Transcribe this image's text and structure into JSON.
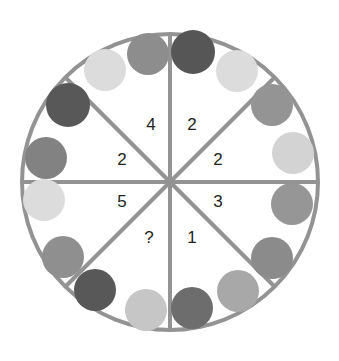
{
  "figure": {
    "title": "",
    "type": "circular-sector-dot-puzzle",
    "background_color": "#ffffff",
    "outline_color": "#939393",
    "spoke_color": "#939393",
    "outline_width": 4,
    "spoke_width": 4,
    "center": {
      "x": 170,
      "y": 182
    },
    "radius": 148
  },
  "chart_data": {
    "type": "pie",
    "title": "",
    "subtitle": "",
    "xlabel": "",
    "ylabel": "",
    "grid": false,
    "legend": "none",
    "note": "Circle split into 8 equal 45-degree sectors. Each sector carries a number label; gray dots sit near the rim inside each sector.",
    "categories": [
      "top-right",
      "right-upper",
      "right-lower",
      "bottom-right",
      "bottom-left",
      "left-lower",
      "left-upper",
      "top-left"
    ],
    "values": [
      2,
      2,
      3,
      1,
      2,
      5,
      2,
      4
    ],
    "labels": [
      "2",
      "2",
      "3",
      "1",
      "?",
      "5",
      "2",
      "4"
    ],
    "dot_counts": [
      2,
      2,
      3,
      1,
      2,
      5,
      2,
      4
    ],
    "unknown_label": "?",
    "unknown_sector": "bottom-left"
  },
  "sectors": [
    {
      "id": "sector-top-right",
      "label": "2",
      "label_x": 192,
      "label_y": 126
    },
    {
      "id": "sector-right-upper",
      "label": "2",
      "label_x": 218,
      "label_y": 161
    },
    {
      "id": "sector-right-lower",
      "label": "3",
      "label_x": 218,
      "label_y": 203
    },
    {
      "id": "sector-bottom-right",
      "label": "1",
      "label_x": 192,
      "label_y": 239
    },
    {
      "id": "sector-bottom-left",
      "label": "?",
      "label_x": 149,
      "label_y": 239
    },
    {
      "id": "sector-left-lower",
      "label": "5",
      "label_x": 122,
      "label_y": 203
    },
    {
      "id": "sector-left-upper",
      "label": "2",
      "label_x": 122,
      "label_y": 161
    },
    {
      "id": "sector-top-left",
      "label": "4",
      "label_x": 151,
      "label_y": 126
    }
  ],
  "spokes": [
    {
      "id": "spoke-vertical",
      "x1": 170,
      "y1": 34,
      "x2": 170,
      "y2": 330
    },
    {
      "id": "spoke-horizontal",
      "x1": 22,
      "y1": 182,
      "x2": 318,
      "y2": 182
    },
    {
      "id": "spoke-diagonal-nwse",
      "x1": 65,
      "y1": 77,
      "x2": 275,
      "y2": 287
    },
    {
      "id": "spoke-diagonal-nesw",
      "x1": 275,
      "y1": 77,
      "x2": 65,
      "y2": 287
    }
  ],
  "dots": [
    {
      "id": "dot-01",
      "sector": "top-left",
      "cx": 105,
      "cy": 70,
      "r": 21,
      "color": "#dcdcdc",
      "shade": "very-light"
    },
    {
      "id": "dot-02",
      "sector": "top-left",
      "cx": 148,
      "cy": 54,
      "r": 21,
      "color": "#8d8d8d",
      "shade": "medium"
    },
    {
      "id": "dot-03",
      "sector": "top-right",
      "cx": 193,
      "cy": 52,
      "r": 22,
      "color": "#565656",
      "shade": "dark"
    },
    {
      "id": "dot-04",
      "sector": "top-right",
      "cx": 237,
      "cy": 71,
      "r": 21,
      "color": "#dcdcdc",
      "shade": "very-light"
    },
    {
      "id": "dot-05",
      "sector": "right-upper",
      "cx": 272,
      "cy": 105,
      "r": 21,
      "color": "#949494",
      "shade": "medium"
    },
    {
      "id": "dot-06",
      "sector": "right-upper",
      "cx": 293,
      "cy": 153,
      "r": 21,
      "color": "#d3d3d3",
      "shade": "light"
    },
    {
      "id": "dot-07",
      "sector": "right-lower",
      "cx": 292,
      "cy": 204,
      "r": 21,
      "color": "#969696",
      "shade": "medium"
    },
    {
      "id": "dot-08",
      "sector": "right-lower",
      "cx": 272,
      "cy": 258,
      "r": 21,
      "color": "#8b8b8b",
      "shade": "medium"
    },
    {
      "id": "dot-09",
      "sector": "bottom-right",
      "cx": 238,
      "cy": 291,
      "r": 21,
      "color": "#a8a8a8",
      "shade": "light-medium"
    },
    {
      "id": "dot-10",
      "sector": "bottom-right",
      "cx": 192,
      "cy": 308,
      "r": 21,
      "color": "#6d6d6d",
      "shade": "dark"
    },
    {
      "id": "dot-11",
      "sector": "bottom-left",
      "cx": 146,
      "cy": 310,
      "r": 21,
      "color": "#c6c6c6",
      "shade": "light"
    },
    {
      "id": "dot-12",
      "sector": "bottom-left",
      "cx": 95,
      "cy": 290,
      "r": 21,
      "color": "#585858",
      "shade": "dark"
    },
    {
      "id": "dot-13",
      "sector": "left-lower",
      "cx": 63,
      "cy": 257,
      "r": 21,
      "color": "#8f8f8f",
      "shade": "medium"
    },
    {
      "id": "dot-14",
      "sector": "left-lower",
      "cx": 44,
      "cy": 200,
      "r": 21,
      "color": "#dcdcdc",
      "shade": "very-light"
    },
    {
      "id": "dot-15",
      "sector": "left-upper",
      "cx": 46,
      "cy": 158,
      "r": 21,
      "color": "#828282",
      "shade": "medium"
    },
    {
      "id": "dot-16",
      "sector": "left-upper",
      "cx": 68,
      "cy": 105,
      "r": 22,
      "color": "#585858",
      "shade": "dark"
    }
  ]
}
